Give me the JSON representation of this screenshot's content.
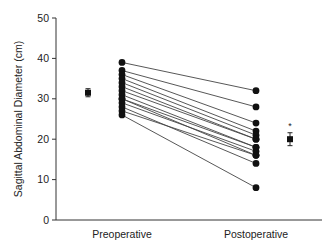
{
  "chart_data": {
    "type": "scatter",
    "title": "",
    "xlabel": "",
    "ylabel": "Sagittal Abdominal Diameter (cm)",
    "ylim": [
      0,
      50
    ],
    "yticks": [
      0,
      10,
      20,
      30,
      40,
      50
    ],
    "categories": [
      "Preoperative",
      "Postoperative"
    ],
    "grid": false,
    "legend": null,
    "paired_lines": true,
    "pairs": [
      {
        "pre": 39,
        "post": 32
      },
      {
        "pre": 37,
        "post": 28
      },
      {
        "pre": 36,
        "post": 24
      },
      {
        "pre": 35,
        "post": 22
      },
      {
        "pre": 34,
        "post": 21
      },
      {
        "pre": 33,
        "post": 20
      },
      {
        "pre": 32,
        "post": 20
      },
      {
        "pre": 31,
        "post": 18
      },
      {
        "pre": 30,
        "post": 18
      },
      {
        "pre": 30,
        "post": 16
      },
      {
        "pre": 29,
        "post": 17
      },
      {
        "pre": 28,
        "post": 14
      },
      {
        "pre": 27,
        "post": 16
      },
      {
        "pre": 26,
        "post": 8
      }
    ],
    "summary": [
      {
        "group": "Preoperative",
        "mean": 31.5,
        "error": 1.0
      },
      {
        "group": "Postoperative",
        "mean": 20,
        "error": 1.6,
        "annotation": "*"
      }
    ],
    "colors": {
      "points": "#111111",
      "lines": "#444444",
      "axis": "#333333"
    }
  }
}
